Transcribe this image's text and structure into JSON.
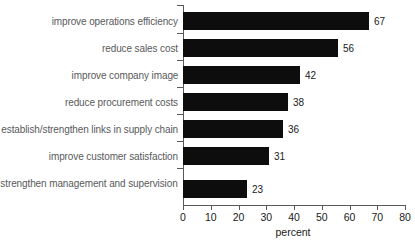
{
  "chart_data": {
    "type": "bar",
    "orientation": "horizontal",
    "title": "",
    "subtitle": "",
    "xlabel": "percent",
    "ylabel": "",
    "xlim": [
      0,
      80
    ],
    "xticks": [
      0,
      10,
      20,
      30,
      40,
      50,
      60,
      70,
      80
    ],
    "xtick_labels": [
      "0",
      "10",
      "20",
      "30",
      "40",
      "50",
      "60",
      "70",
      "80"
    ],
    "grid": false,
    "legend": false,
    "bar_color": "#0d0d0d",
    "label_color": "#58595b",
    "axis_color": "#58595b",
    "background": "#ffffff",
    "categories": [
      "improve operations efficiency",
      "reduce sales cost",
      "improve company image",
      "reduce procurement costs",
      "establish/strengthen links in supply chain",
      "improve customer satisfaction",
      "strengthen management and supervision"
    ],
    "values": [
      67,
      56,
      42,
      38,
      36,
      31,
      23
    ],
    "value_labels": [
      "67",
      "56",
      "42",
      "38",
      "36",
      "31",
      "23"
    ],
    "bars": [
      {
        "category": "improve operations efficiency",
        "value": 67,
        "label": "67"
      },
      {
        "category": "reduce sales cost",
        "value": 56,
        "label": "56"
      },
      {
        "category": "improve company image",
        "value": 42,
        "label": "42"
      },
      {
        "category": "reduce procurement costs",
        "value": 38,
        "label": "38"
      },
      {
        "category": "establish/strengthen links in supply chain",
        "value": 36,
        "label": "36"
      },
      {
        "category": "improve customer satisfaction",
        "value": 31,
        "label": "31"
      },
      {
        "category": "strengthen management and supervision",
        "value": 23,
        "label": "23"
      }
    ]
  }
}
